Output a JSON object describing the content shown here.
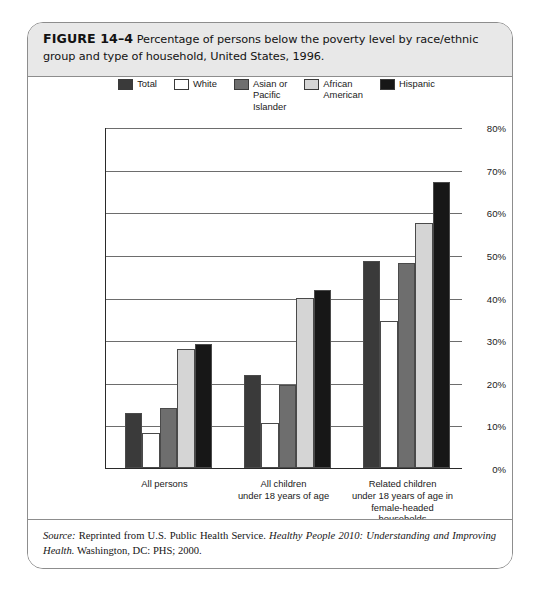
{
  "figure": {
    "label": "FIGURE 14–4",
    "caption": "Percentage of persons below the poverty level by race/ethnic group and type of household, United States, 1996."
  },
  "source": {
    "prefix": "Source:",
    "body_1": " Reprinted from U.S. Public Health Service. ",
    "title": "Healthy People 2010: Understanding and Improving Health.",
    "body_2": " Washington, DC: PHS; 2000."
  },
  "chart_data": {
    "type": "bar",
    "title": "Percentage of persons below the poverty level by race/ethnic group and type of household, United States, 1996.",
    "xlabel": "",
    "ylabel": "",
    "ylim": [
      0,
      80
    ],
    "ytick_labels": [
      "80%",
      "70%",
      "60%",
      "50%",
      "40%",
      "30%",
      "20%",
      "10%",
      "0%"
    ],
    "ytick_values": [
      80,
      70,
      60,
      50,
      40,
      30,
      20,
      10,
      0
    ],
    "grid": true,
    "legend_position": "top",
    "categories": [
      "All persons",
      "All children\nunder 18 years of age",
      "Related children\nunder 18 years of age in\nfemale-headed households"
    ],
    "series": [
      {
        "name": "Total",
        "label": "Total",
        "color": "#3a3a3a",
        "values": [
          13.0,
          21.9,
          48.5
        ]
      },
      {
        "name": "White",
        "label": "White",
        "color": "#ffffff",
        "values": [
          8.2,
          10.5,
          34.5
        ]
      },
      {
        "name": "Asian or Pacific Islander",
        "label": "Asian or\nPacific\nIslander",
        "color": "#6e6e6e",
        "values": [
          14.0,
          19.4,
          48.0
        ]
      },
      {
        "name": "African American",
        "label": "African\nAmerican",
        "color": "#d5d5d5",
        "values": [
          28.0,
          39.8,
          57.5
        ]
      },
      {
        "name": "Hispanic",
        "label": "Hispanic",
        "color": "#171717",
        "values": [
          29.0,
          41.8,
          67.0
        ]
      }
    ]
  }
}
